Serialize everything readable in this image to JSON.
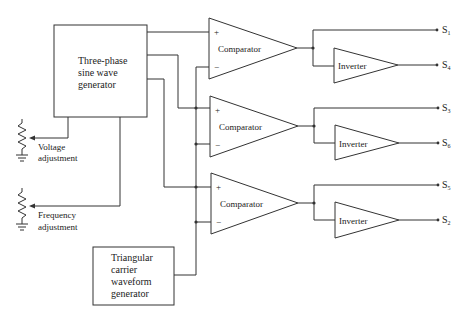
{
  "diagram": {
    "generator": {
      "lines": [
        "Three-phase",
        "sine wave",
        "generator"
      ]
    },
    "carrier": {
      "lines": [
        "Triangular",
        "carrier",
        "waveform",
        "generator"
      ]
    },
    "voltage_adjust": {
      "lines": [
        "Voltage",
        "adjustment"
      ]
    },
    "frequency_adjust": {
      "lines": [
        "Frequency",
        "adjustment"
      ]
    },
    "comparators": [
      {
        "label": "Comparator",
        "plus": "+",
        "minus": "−",
        "out_direct": {
          "s": "S",
          "n": "1"
        },
        "out_inverted": {
          "s": "S",
          "n": "4"
        }
      },
      {
        "label": "Comparator",
        "plus": "+",
        "minus": "−",
        "out_direct": {
          "s": "S",
          "n": "3"
        },
        "out_inverted": {
          "s": "S",
          "n": "6"
        }
      },
      {
        "label": "Comparator",
        "plus": "+",
        "minus": "−",
        "out_direct": {
          "s": "S",
          "n": "5"
        },
        "out_inverted": {
          "s": "S",
          "n": "2"
        }
      }
    ],
    "inverter_label": "Inverter"
  }
}
